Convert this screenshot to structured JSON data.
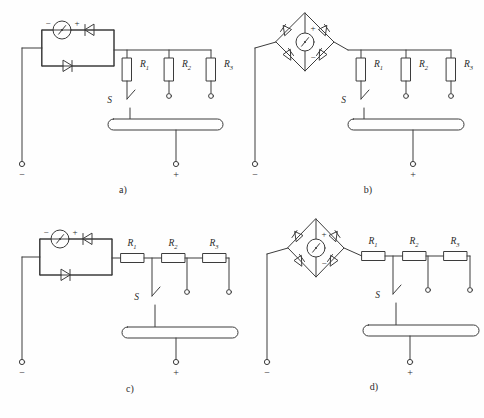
{
  "figure": {
    "background": "#fefefe",
    "stroke": "#3c3c3c",
    "stroke_light": "#6d6d6d",
    "text_color": "#2b2b2b"
  },
  "panels": [
    {
      "id": "a",
      "caption": "a)",
      "source_type": "meter-with-antiparallel-diodes",
      "resistor_orientation": "vertical",
      "meter": {
        "symbol": "ammeter-needle",
        "minus": "−",
        "plus": "+"
      },
      "diodes": [
        {
          "name": "diode-top",
          "direction": "left"
        },
        {
          "name": "diode-bottom",
          "direction": "right"
        }
      ],
      "resistors": [
        {
          "label": "R",
          "sub": "1"
        },
        {
          "label": "R",
          "sub": "2"
        },
        {
          "label": "R",
          "sub": "3"
        }
      ],
      "switch": {
        "label": "S"
      },
      "busbar": {
        "name": "rail"
      },
      "terminals": [
        {
          "name": "negative-terminal",
          "sign": "−"
        },
        {
          "name": "positive-terminal",
          "sign": "+"
        }
      ]
    },
    {
      "id": "b",
      "caption": "b)",
      "source_type": "bridge-rectifier-with-meter",
      "resistor_orientation": "vertical",
      "meter": {
        "symbol": "ammeter-needle",
        "plus": "+",
        "minus": "−"
      },
      "diodes": [
        {
          "name": "bridge-diode-top-left"
        },
        {
          "name": "bridge-diode-top-right"
        },
        {
          "name": "bridge-diode-bottom-left"
        },
        {
          "name": "bridge-diode-bottom-right"
        }
      ],
      "resistors": [
        {
          "label": "R",
          "sub": "1"
        },
        {
          "label": "R",
          "sub": "2"
        },
        {
          "label": "R",
          "sub": "3"
        }
      ],
      "switch": {
        "label": "S"
      },
      "busbar": {
        "name": "rail"
      },
      "terminals": [
        {
          "name": "negative-terminal",
          "sign": "−"
        },
        {
          "name": "positive-terminal",
          "sign": "+"
        }
      ]
    },
    {
      "id": "c",
      "caption": "c)",
      "source_type": "meter-with-antiparallel-diodes",
      "resistor_orientation": "horizontal",
      "meter": {
        "symbol": "ammeter-needle",
        "minus": "−",
        "plus": "+"
      },
      "diodes": [
        {
          "name": "diode-top",
          "direction": "left"
        },
        {
          "name": "diode-bottom",
          "direction": "right"
        }
      ],
      "resistors": [
        {
          "label": "R",
          "sub": "1"
        },
        {
          "label": "R",
          "sub": "2"
        },
        {
          "label": "R",
          "sub": "3"
        }
      ],
      "switch": {
        "label": "S"
      },
      "busbar": {
        "name": "rail"
      },
      "terminals": [
        {
          "name": "negative-terminal",
          "sign": "−"
        },
        {
          "name": "positive-terminal",
          "sign": "+"
        }
      ]
    },
    {
      "id": "d",
      "caption": "d)",
      "source_type": "bridge-rectifier-with-meter",
      "resistor_orientation": "horizontal",
      "meter": {
        "symbol": "ammeter-needle",
        "plus": "+",
        "minus": "−"
      },
      "diodes": [
        {
          "name": "bridge-diode-top-left"
        },
        {
          "name": "bridge-diode-top-right"
        },
        {
          "name": "bridge-diode-bottom-left"
        },
        {
          "name": "bridge-diode-bottom-right"
        }
      ],
      "resistors": [
        {
          "label": "R",
          "sub": "1"
        },
        {
          "label": "R",
          "sub": "2"
        },
        {
          "label": "R",
          "sub": "3"
        }
      ],
      "switch": {
        "label": "S"
      },
      "busbar": {
        "name": "rail"
      },
      "terminals": [
        {
          "name": "negative-terminal",
          "sign": "−"
        },
        {
          "name": "positive-terminal",
          "sign": "+"
        }
      ]
    }
  ]
}
